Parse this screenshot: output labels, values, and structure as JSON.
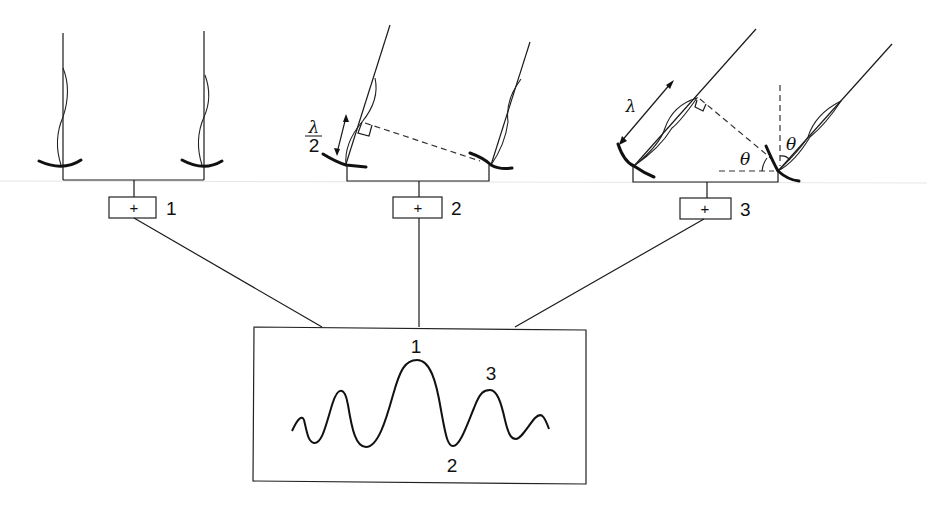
{
  "diagram": {
    "configurations": [
      {
        "id": 1,
        "label": "1",
        "summer_symbol": "+",
        "description": "Wavefront arrives normal to baseline; signals in phase"
      },
      {
        "id": 2,
        "label": "2",
        "summer_symbol": "+",
        "description": "Path difference of half a wavelength; signals cancel",
        "path_difference_label_num": "λ",
        "path_difference_label_den": "2"
      },
      {
        "id": 3,
        "label": "3",
        "summer_symbol": "+",
        "description": "Path difference of one wavelength; signals add",
        "path_difference_label": "λ",
        "angle_label_1": "θ",
        "angle_label_2": "θ"
      }
    ],
    "output_box": {
      "description": "Resulting fringe pattern",
      "peak_labels": [
        "1",
        "2",
        "3"
      ]
    }
  }
}
